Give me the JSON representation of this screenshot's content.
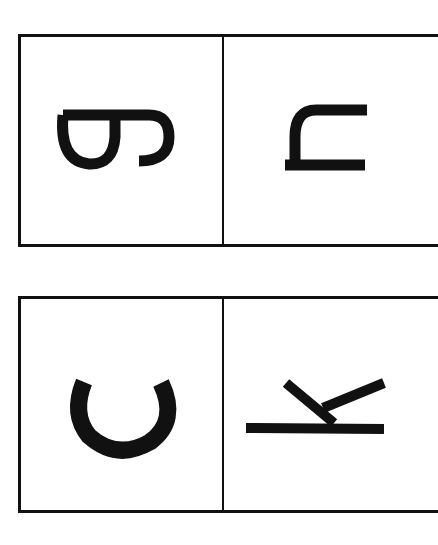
{
  "cards": [
    {
      "cells": [
        {
          "letter": "g",
          "orientation": "rotated-90-cw",
          "icon": "rotated-letter-g"
        },
        {
          "letter": "n",
          "orientation": "rotated-90-cw",
          "icon": "rotated-letter-n"
        }
      ]
    },
    {
      "cells": [
        {
          "letter": "c",
          "orientation": "rotated-90-cw",
          "icon": "rotated-letter-c"
        },
        {
          "letter": "k",
          "orientation": "rotated-90-cw",
          "icon": "rotated-letter-k"
        }
      ]
    }
  ],
  "colors": {
    "ink": "#111111",
    "background": "#ffffff"
  }
}
